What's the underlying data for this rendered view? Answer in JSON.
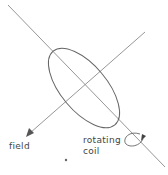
{
  "diagram": {
    "type": "physics-schematic",
    "labels": {
      "field": "field",
      "coil_line1": "rotating",
      "coil_line2": "coil"
    },
    "elements": [
      {
        "name": "coil-axis-line",
        "desc": "rotation axis of coil, diagonal from top-left to bottom-right"
      },
      {
        "name": "field-vector",
        "desc": "magnetic field arrow pointing down-left"
      },
      {
        "name": "coil-loop",
        "desc": "elliptical coil in perspective"
      },
      {
        "name": "rotation-arrow",
        "desc": "curved arrow indicating rotation around axis"
      }
    ],
    "colors": {
      "stroke": "#7a7a7a",
      "text": "#444444",
      "background": "#ffffff"
    }
  }
}
